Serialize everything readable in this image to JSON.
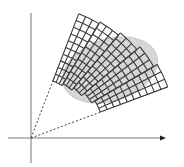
{
  "figure": {
    "colors": {
      "background": "#ffffff",
      "axes": "#777777",
      "arrowhead": "#222222",
      "grid": "#3a3a3a",
      "ellipse_fill": "#d6d6d6",
      "rays": "#444444"
    },
    "origin": [
      31,
      138
    ],
    "axes": {
      "x": {
        "from": [
          8,
          138
        ],
        "to": [
          166,
          138
        ],
        "arrow": true
      },
      "y": {
        "from": [
          31,
          13
        ],
        "to": [
          31,
          163
        ],
        "arrow": false
      }
    },
    "rays": [
      {
        "name": "upper-bounding-ray",
        "to_angle_deg": 69,
        "length": 62
      },
      {
        "name": "lower-bounding-ray",
        "to_angle_deg": 20.5,
        "length": 74
      }
    ],
    "ellipse": {
      "cx": 110,
      "cy": 70,
      "rx": 49,
      "ry": 31,
      "rotate_deg": -18
    },
    "grid": {
      "angle_start_deg": 20.5,
      "angle_end_deg": 69,
      "bands": [
        {
          "columns": 3,
          "r_start": 74,
          "cells": 10
        },
        {
          "columns": 3,
          "r_start": 70,
          "cells": 10
        },
        {
          "columns": 3,
          "r_start": 66,
          "cells": 10
        },
        {
          "columns": 3,
          "r_start": 63,
          "cells": 10
        },
        {
          "columns": 3,
          "r_start": 61,
          "cells": 10
        }
      ],
      "cell_radial_px": 7.2
    }
  }
}
